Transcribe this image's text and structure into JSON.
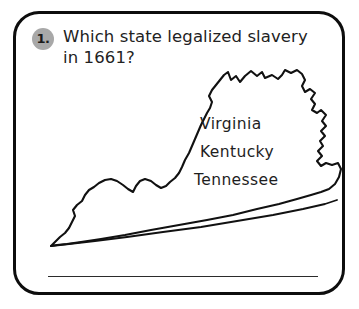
{
  "question": {
    "number": "1.",
    "text": "Which state legalized slavery\nin 1661?"
  },
  "map": {
    "icon_name": "virginia-state-outline",
    "stroke_color": "#111111",
    "fill_color": "#ffffff"
  },
  "options": [
    {
      "label": "Virginia"
    },
    {
      "label": "Kentucky"
    },
    {
      "label": "Tennessee"
    }
  ],
  "answer_line": {
    "value": "",
    "placeholder": ""
  },
  "card": {
    "border_color": "#0d0d0d",
    "background_color": "#ffffff",
    "badge_color": "#a8a8a8"
  }
}
